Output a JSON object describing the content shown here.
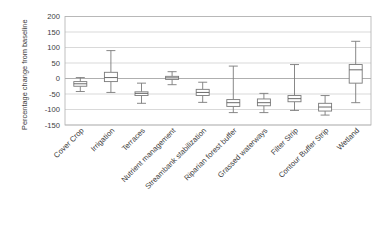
{
  "chart_data": {
    "type": "box",
    "title": "",
    "subtitle": "",
    "xlabel": "",
    "ylabel": "Percentage change from baseline",
    "ylim": [
      -150,
      200
    ],
    "yticks": [
      -150,
      -100,
      -50,
      0,
      50,
      100,
      150,
      200
    ],
    "ytick_labels": [
      "-150",
      "-100",
      "-50",
      "0",
      "50",
      "100",
      "150",
      "200"
    ],
    "grid": true,
    "legend": "none",
    "categories": [
      "Cover Crop",
      "Irrigation",
      "Terraces",
      "Nutrient management",
      "Streambank stabilization",
      "Riparian forest buffer",
      "Grassed waterways",
      "Filter Strip",
      "Contour Buffer Strip",
      "Wetland"
    ],
    "boxes": [
      {
        "name": "Cover Crop",
        "whisker_low": -42,
        "q1": -25,
        "median": -17,
        "q3": -10,
        "whisker_high": 3
      },
      {
        "name": "Irrigation",
        "whisker_low": -45,
        "q1": -10,
        "median": 3,
        "q3": 20,
        "whisker_high": 90
      },
      {
        "name": "Terraces",
        "whisker_low": -80,
        "q1": -55,
        "median": -48,
        "q3": -43,
        "whisker_high": -15
      },
      {
        "name": "Nutrient management",
        "whisker_low": -20,
        "q1": -3,
        "median": 2,
        "q3": 7,
        "whisker_high": 22
      },
      {
        "name": "Streambank stabilization",
        "whisker_low": -77,
        "q1": -55,
        "median": -45,
        "q3": -35,
        "whisker_high": -12
      },
      {
        "name": "Riparian forest buffer",
        "whisker_low": -110,
        "q1": -90,
        "median": -78,
        "q3": -68,
        "whisker_high": 40
      },
      {
        "name": "Grassed waterways",
        "whisker_low": -110,
        "q1": -88,
        "median": -78,
        "q3": -66,
        "whisker_high": -48
      },
      {
        "name": "Filter Strip",
        "whisker_low": -103,
        "q1": -75,
        "median": -65,
        "q3": -55,
        "whisker_high": 45
      },
      {
        "name": "Contour Buffer Strip",
        "whisker_low": -118,
        "q1": -105,
        "median": -92,
        "q3": -80,
        "whisker_high": -55
      },
      {
        "name": "Wetland",
        "whisker_low": -78,
        "q1": -15,
        "median": 28,
        "q3": 45,
        "whisker_high": 120
      }
    ]
  },
  "axis": {
    "y_title": "Percentage change from baseline"
  }
}
